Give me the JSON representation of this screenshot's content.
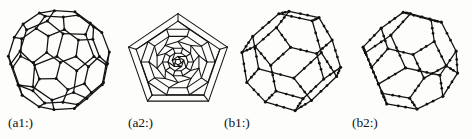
{
  "figure": {
    "background_color": "#fdfdfc",
    "ink_color": "#131313",
    "kind": "polyhedral-cage-diagram",
    "panel_count": 4
  },
  "panels": [
    {
      "id": "a1",
      "label": "(a1:)",
      "description": "truncated-icosahedron-cage",
      "style": "3d-perspective-cage",
      "vertex_markers": true,
      "vertex_count": 60,
      "face_types": [
        "pentagon",
        "hexagon"
      ]
    },
    {
      "id": "a2",
      "label": "(a2:)",
      "description": "pentagonal-schlegel-diagram",
      "style": "planar-projection",
      "vertex_markers": false,
      "outer_face": "pentagon",
      "face_types": [
        "pentagon",
        "hexagon"
      ]
    },
    {
      "id": "b1",
      "label": "(b1:)",
      "description": "truncated-cage-with-triangular-faces",
      "style": "3d-perspective-cage",
      "vertex_markers": true,
      "face_types": [
        "triangle",
        "square",
        "hexagon"
      ]
    },
    {
      "id": "b2",
      "label": "(b2:)",
      "description": "truncated-cage-with-triangular-faces-alternate-view",
      "style": "3d-perspective-cage",
      "vertex_markers": true,
      "face_types": [
        "triangle",
        "square",
        "hexagon"
      ]
    }
  ]
}
